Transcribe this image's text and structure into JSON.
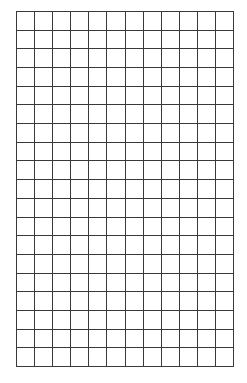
{
  "grid": {
    "columns": 12,
    "rows": 19,
    "left": 16,
    "top": 11,
    "width": 217,
    "height": 355,
    "line_color": "#3a3a3a",
    "line_width": 1,
    "background": "#ffffff"
  }
}
